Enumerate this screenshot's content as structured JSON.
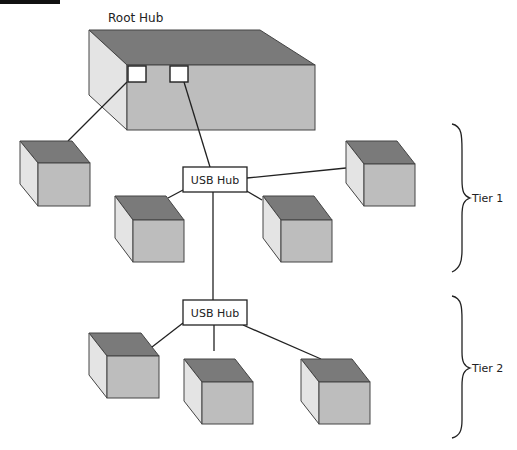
{
  "diagram": {
    "title_bar": "",
    "root_hub_label": "Root Hub",
    "hub1_label": "USB Hub",
    "hub2_label": "USB Hub",
    "tier1_label": "Tier 1",
    "tier2_label": "Tier 2"
  },
  "colors": {
    "top_face": "#7a7a7a",
    "front_face": "#bdbdbd",
    "side_face": "#e4e4e4",
    "stroke": "#333333",
    "title_bar": "#111111"
  }
}
